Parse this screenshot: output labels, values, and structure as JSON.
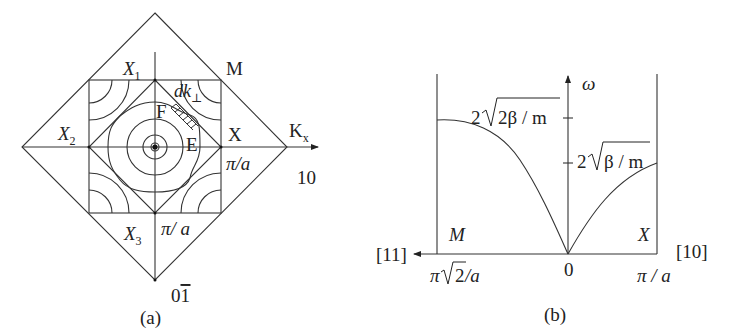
{
  "figure_a": {
    "caption": "(a)",
    "labels": {
      "x1": "X",
      "x1_sub": "1",
      "x2": "X",
      "x2_sub": "2",
      "x3": "X",
      "x3_sub": "3",
      "m": "M",
      "x": "X",
      "kx": "K",
      "kx_sub": "x",
      "dk": "dk",
      "dk_sub": "⊥",
      "f": "F",
      "e": "E",
      "pi_a_right": "π/a",
      "pi_a_bottom": "π/ a",
      "dir_10": "10",
      "dir_01bar": "0",
      "dir_01bar_bar": "1"
    }
  },
  "figure_b": {
    "caption": "(b)",
    "labels": {
      "omega": "ω",
      "omega_max_11": "2√(2β / m)",
      "omega_max_11_coef": "2",
      "omega_max_11_rad": "2β / m",
      "omega_max_10_coef": "2",
      "omega_max_10_rad": "β / m",
      "m": "M",
      "x": "X",
      "dir_11": "[11]",
      "dir_10": "[10]",
      "origin": "0",
      "k_11": "π√2/a",
      "k_11_pi": "π",
      "k_11_rad": "2",
      "k_11_a": "/a",
      "k_10": "π / a"
    }
  }
}
